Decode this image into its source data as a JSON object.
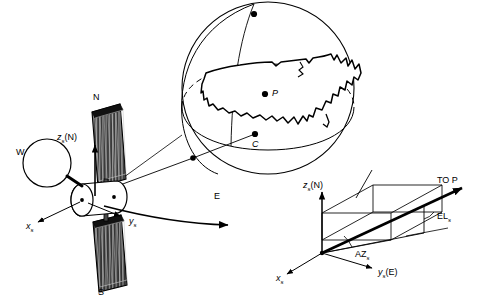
{
  "figure": {
    "background_color": "#ffffff",
    "line_color": "#000000",
    "panel_fill_color": "#2b2b2b",
    "width": 482,
    "height": 301
  },
  "satellite": {
    "north_panel_label": "N",
    "south_panel_label": "S",
    "west_antenna_label": "W",
    "east_direction_label": "E",
    "axis_z_symbol": "z",
    "axis_z_subscript": "s",
    "axis_z_paren": "(N)",
    "axis_x_symbol": "x",
    "axis_x_subscript": "s",
    "axis_y_symbol": "y",
    "axis_y_subscript": "s"
  },
  "globe": {
    "target_point_label": "P",
    "center_point_label": "C"
  },
  "inset": {
    "axis_z_symbol": "z",
    "axis_z_subscript": "s",
    "axis_z_paren": "(N)",
    "axis_x_symbol": "x",
    "axis_x_subscript": "s",
    "axis_y_symbol": "y",
    "axis_y_subscript": "s",
    "axis_y_paren": "(E)",
    "azimuth_symbol": "AZ",
    "azimuth_subscript": "s",
    "elevation_symbol": "EL",
    "elevation_subscript": "s",
    "to_point_label": "TO P"
  }
}
